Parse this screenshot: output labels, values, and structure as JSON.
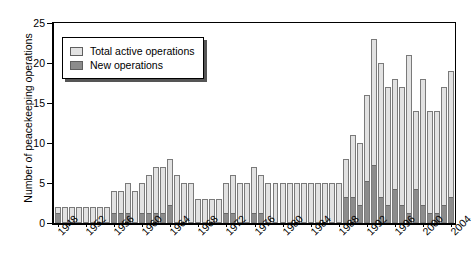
{
  "chart_data": {
    "type": "bar",
    "title": "",
    "subtitle": "",
    "xlabel": "",
    "ylabel": "Number of peacekeeping operations",
    "ylim": [
      0,
      25
    ],
    "yticks": [
      0,
      5,
      10,
      15,
      20,
      25
    ],
    "grid": false,
    "legend_position": "upper-left-inside",
    "stacked": true,
    "xtick_labels": [
      "1948",
      "1952",
      "1956",
      "1960",
      "1964",
      "1968",
      "1972",
      "1976",
      "1980",
      "1984",
      "1988",
      "1992",
      "1996",
      "2000",
      "2004"
    ],
    "xtick_step_years": 4,
    "categories": [
      "1948",
      "1949",
      "1950",
      "1951",
      "1952",
      "1953",
      "1954",
      "1955",
      "1956",
      "1957",
      "1958",
      "1959",
      "1960",
      "1961",
      "1962",
      "1963",
      "1964",
      "1965",
      "1966",
      "1967",
      "1968",
      "1969",
      "1970",
      "1971",
      "1972",
      "1973",
      "1974",
      "1975",
      "1976",
      "1977",
      "1978",
      "1979",
      "1980",
      "1981",
      "1982",
      "1983",
      "1984",
      "1985",
      "1986",
      "1987",
      "1988",
      "1989",
      "1990",
      "1991",
      "1992",
      "1993",
      "1994",
      "1995",
      "1996",
      "1997",
      "1998",
      "1999",
      "2000",
      "2001",
      "2002",
      "2003",
      "2004"
    ],
    "series": [
      {
        "name": "Total active operations",
        "color": "#e2e2e2",
        "values": [
          2,
          2,
          2,
          2,
          2,
          2,
          2,
          2,
          4,
          4,
          5,
          4,
          5,
          6,
          7,
          7,
          8,
          6,
          5,
          5,
          3,
          3,
          3,
          3,
          5,
          6,
          5,
          5,
          7,
          6,
          5,
          5,
          5,
          5,
          5,
          5,
          5,
          5,
          5,
          5,
          5,
          8,
          11,
          10,
          16,
          23,
          20,
          17,
          18,
          17,
          21,
          14,
          18,
          14,
          14,
          17,
          19
        ]
      },
      {
        "name": "New operations",
        "color": "#8c8c8c",
        "values": [
          1,
          0,
          0,
          0,
          0,
          0,
          0,
          0,
          1,
          1,
          1,
          0,
          1,
          1,
          1,
          1,
          2,
          0,
          0,
          0,
          0,
          0,
          0,
          0,
          1,
          1,
          0,
          0,
          1,
          1,
          0,
          0,
          0,
          0,
          0,
          0,
          0,
          0,
          0,
          0,
          0,
          3,
          3,
          2,
          5,
          7,
          3,
          2,
          4,
          2,
          1,
          4,
          2,
          1,
          1,
          2,
          3
        ]
      }
    ]
  },
  "legend": {
    "items": [
      {
        "label": "Total active operations",
        "swatch": "sw-total"
      },
      {
        "label": "New operations",
        "swatch": "sw-new"
      }
    ]
  }
}
